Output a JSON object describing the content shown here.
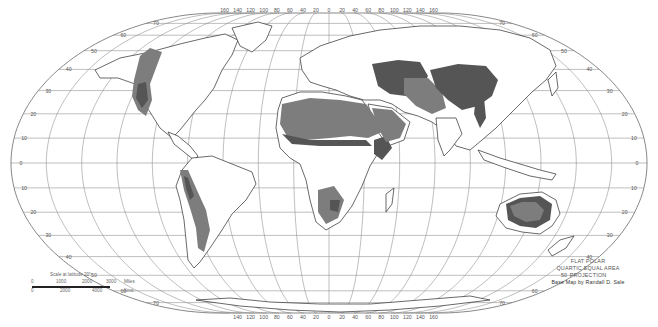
{
  "map": {
    "projection_title": [
      "FLAT POLAR",
      "QUARTIC EQUAL AREA",
      "PROJECTION"
    ],
    "credit": "Base Map by Randall D. Sale",
    "subject": "World distribution of dry (arid and semiarid) lands",
    "colors": {
      "background": "#ffffff",
      "land_fill": "#ffffff",
      "coastline": "#2a2a2a",
      "graticule": "#8a8a8a",
      "semiarid": "#7d7d7d",
      "arid": "#555555"
    },
    "legend_note": "Shading: lighter gray and darker gray dryland zones"
  },
  "scale": {
    "title": "Scale at latitude 20°",
    "miles_label": "Miles",
    "km_label": "Kms.",
    "miles_ticks": [
      "0",
      "1000",
      "2000",
      "3000"
    ],
    "km_ticks": [
      "0",
      "2000",
      "4000"
    ]
  },
  "graticule": {
    "latitudes_left": [
      "40",
      "30",
      "20",
      "10",
      "0",
      "10",
      "20",
      "30",
      "40",
      "50",
      "60",
      "70"
    ],
    "latitudes_right": [
      "60",
      "50",
      "40",
      "30",
      "20",
      "10",
      "0",
      "10",
      "20",
      "30",
      "40",
      "50",
      "60",
      "70"
    ],
    "lat_values": [
      -70,
      -60,
      -50,
      -40,
      -30,
      -20,
      -10,
      0,
      10,
      20,
      30,
      40,
      50,
      60,
      70
    ],
    "lon_top_labels": [
      "160",
      "140",
      "120",
      "100",
      "80",
      "60",
      "40",
      "20",
      "0",
      "20",
      "40",
      "60",
      "80",
      "100",
      "120",
      "140",
      "160"
    ],
    "lon_bottom_labels": [
      "140",
      "120",
      "100",
      "80",
      "60",
      "40",
      "20",
      "0",
      "20",
      "40",
      "60",
      "80",
      "100",
      "120",
      "140",
      "160"
    ],
    "lon_step": 20,
    "lat_step": 10
  }
}
